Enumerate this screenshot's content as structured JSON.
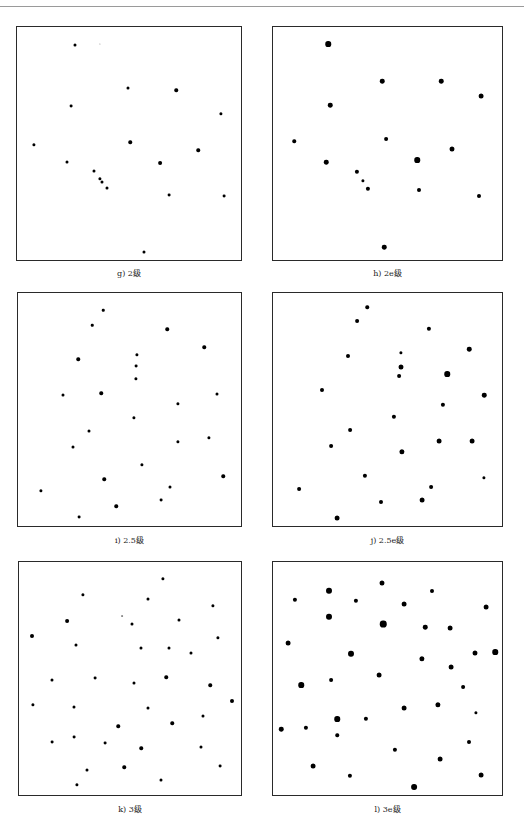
{
  "figure": {
    "panels": [
      {
        "id": "g",
        "caption": "g) 2级",
        "x": 16,
        "y": 26,
        "w": 226,
        "h": 235,
        "caption_y": 267,
        "dots": [
          [
            58,
            18,
            3
          ],
          [
            83,
            17,
            1.2
          ],
          [
            111,
            61,
            3
          ],
          [
            159,
            63,
            3.5
          ],
          [
            54,
            79,
            2.8
          ],
          [
            204,
            87,
            3.2
          ],
          [
            17,
            118,
            3.2
          ],
          [
            113,
            115,
            3.5
          ],
          [
            181,
            123,
            3.5
          ],
          [
            50,
            135,
            3
          ],
          [
            143,
            136,
            3.8
          ],
          [
            77,
            144,
            3
          ],
          [
            83,
            152,
            3.2
          ],
          [
            85,
            155,
            3
          ],
          [
            90,
            161,
            3
          ],
          [
            152,
            168,
            2.8
          ],
          [
            207,
            169,
            2.8
          ],
          [
            127,
            225,
            3
          ]
        ]
      },
      {
        "id": "h",
        "caption": "h) 2e级",
        "x": 272,
        "y": 26,
        "w": 231,
        "h": 235,
        "caption_y": 267,
        "dots": [
          [
            55,
            17,
            5.5
          ],
          [
            109,
            54,
            4.5
          ],
          [
            168,
            54,
            4.5
          ],
          [
            208,
            69,
            4.8
          ],
          [
            57,
            78,
            4.5
          ],
          [
            21,
            114,
            3.5
          ],
          [
            113,
            112,
            3.8
          ],
          [
            179,
            122,
            5
          ],
          [
            53,
            135,
            4.5
          ],
          [
            144,
            133,
            5.5
          ],
          [
            84,
            145,
            4.2
          ],
          [
            90,
            154,
            3.2
          ],
          [
            95,
            162,
            4.2
          ],
          [
            146,
            163,
            4
          ],
          [
            206,
            169,
            4
          ],
          [
            111,
            220,
            4.5
          ]
        ]
      },
      {
        "id": "i",
        "caption": "i) 2.5级",
        "x": 17,
        "y": 292,
        "w": 225,
        "h": 235,
        "caption_y": 534,
        "dots": [
          [
            85,
            17,
            2.5
          ],
          [
            74,
            32,
            2.5
          ],
          [
            149,
            36,
            3.5
          ],
          [
            186,
            54,
            3.5
          ],
          [
            60,
            66,
            3.5
          ],
          [
            119,
            62,
            3.2
          ],
          [
            118,
            73,
            2.8
          ],
          [
            118,
            86,
            3.2
          ],
          [
            45,
            102,
            3
          ],
          [
            83,
            100,
            3.5
          ],
          [
            199,
            101,
            3
          ],
          [
            160,
            111,
            3.2
          ],
          [
            116,
            125,
            3.2
          ],
          [
            71,
            138,
            3
          ],
          [
            191,
            145,
            3.2
          ],
          [
            55,
            154,
            3
          ],
          [
            160,
            149,
            3.2
          ],
          [
            124,
            172,
            3.2
          ],
          [
            205,
            183,
            3.5
          ],
          [
            86,
            186,
            3.5
          ],
          [
            23,
            198,
            3.2
          ],
          [
            152,
            194,
            3
          ],
          [
            143,
            207,
            2.8
          ],
          [
            98,
            213,
            3.5
          ],
          [
            61,
            224,
            2.8
          ]
        ]
      },
      {
        "id": "j",
        "caption": "j) 2.5e级",
        "x": 272,
        "y": 292,
        "w": 231,
        "h": 235,
        "caption_y": 534,
        "dots": [
          [
            94,
            14,
            3.5
          ],
          [
            84,
            28,
            3.8
          ],
          [
            156,
            36,
            4.2
          ],
          [
            196,
            56,
            4.5
          ],
          [
            75,
            63,
            4
          ],
          [
            128,
            60,
            3.2
          ],
          [
            128,
            74,
            5
          ],
          [
            126,
            83,
            3.8
          ],
          [
            174,
            81,
            5.5
          ],
          [
            49,
            97,
            4
          ],
          [
            211,
            102,
            4.5
          ],
          [
            170,
            112,
            4.2
          ],
          [
            121,
            124,
            4.2
          ],
          [
            77,
            137,
            3.8
          ],
          [
            166,
            148,
            4.8
          ],
          [
            199,
            148,
            4.8
          ],
          [
            58,
            153,
            3.8
          ],
          [
            129,
            159,
            5.2
          ],
          [
            92,
            183,
            4.2
          ],
          [
            211,
            185,
            3.2
          ],
          [
            26,
            196,
            3.8
          ],
          [
            158,
            194,
            3.8
          ],
          [
            108,
            209,
            4
          ],
          [
            149,
            207,
            4.8
          ],
          [
            64,
            225,
            4.8
          ]
        ]
      },
      {
        "id": "k",
        "caption": "k) 3级",
        "x": 18,
        "y": 561,
        "w": 224,
        "h": 235,
        "caption_y": 803,
        "dots": [
          [
            144,
            17,
            3.2
          ],
          [
            64,
            33,
            3.2
          ],
          [
            129,
            37,
            3
          ],
          [
            194,
            44,
            3.2
          ],
          [
            48,
            59,
            3.8
          ],
          [
            103,
            54,
            1.8
          ],
          [
            113,
            62,
            3
          ],
          [
            160,
            58,
            3
          ],
          [
            13,
            74,
            4
          ],
          [
            199,
            76,
            3.2
          ],
          [
            57,
            83,
            3
          ],
          [
            122,
            86,
            3
          ],
          [
            150,
            86,
            3
          ],
          [
            172,
            91,
            3
          ],
          [
            33,
            118,
            3
          ],
          [
            76,
            116,
            2.8
          ],
          [
            147,
            115,
            3.5
          ],
          [
            115,
            121,
            3
          ],
          [
            191,
            123,
            3.5
          ],
          [
            213,
            139,
            4
          ],
          [
            14,
            143,
            3.2
          ],
          [
            55,
            145,
            3
          ],
          [
            129,
            146,
            3
          ],
          [
            184,
            154,
            3
          ],
          [
            99,
            164,
            3.5
          ],
          [
            153,
            161,
            3.5
          ],
          [
            33,
            180,
            2.8
          ],
          [
            55,
            175,
            2.8
          ],
          [
            86,
            181,
            2.8
          ],
          [
            122,
            186,
            3.5
          ],
          [
            182,
            185,
            3
          ],
          [
            68,
            208,
            3
          ],
          [
            105,
            205,
            3.5
          ],
          [
            201,
            204,
            2.8
          ],
          [
            142,
            218,
            3
          ],
          [
            58,
            223,
            3.2
          ]
        ]
      },
      {
        "id": "l",
        "caption": "l) 3e级",
        "x": 272,
        "y": 561,
        "w": 231,
        "h": 235,
        "caption_y": 803,
        "dots": [
          [
            109,
            21,
            5
          ],
          [
            56,
            29,
            6
          ],
          [
            159,
            29,
            4
          ],
          [
            22,
            38,
            4.2
          ],
          [
            83,
            39,
            4.2
          ],
          [
            131,
            42,
            4.8
          ],
          [
            213,
            45,
            4.8
          ],
          [
            56,
            55,
            6
          ],
          [
            110,
            62,
            6.5
          ],
          [
            152,
            65,
            4.5
          ],
          [
            177,
            66,
            4.8
          ],
          [
            15,
            81,
            4.8
          ],
          [
            78,
            92,
            6
          ],
          [
            202,
            91,
            5
          ],
          [
            222,
            90,
            5.5
          ],
          [
            149,
            97,
            5.2
          ],
          [
            178,
            105,
            4.8
          ],
          [
            106,
            113,
            4.8
          ],
          [
            58,
            118,
            3.8
          ],
          [
            28,
            123,
            5.5
          ],
          [
            190,
            125,
            3.8
          ],
          [
            131,
            146,
            4.8
          ],
          [
            165,
            143,
            5.2
          ],
          [
            203,
            151,
            3.2
          ],
          [
            64,
            157,
            5.5
          ],
          [
            93,
            157,
            4.2
          ],
          [
            8,
            167,
            4.5
          ],
          [
            33,
            166,
            4.2
          ],
          [
            64,
            173,
            3.5
          ],
          [
            196,
            180,
            4
          ],
          [
            122,
            188,
            4.2
          ],
          [
            167,
            197,
            4.8
          ],
          [
            40,
            204,
            4.8
          ],
          [
            77,
            214,
            4.2
          ],
          [
            208,
            213,
            4.8
          ],
          [
            141,
            225,
            5.8
          ]
        ]
      }
    ]
  }
}
